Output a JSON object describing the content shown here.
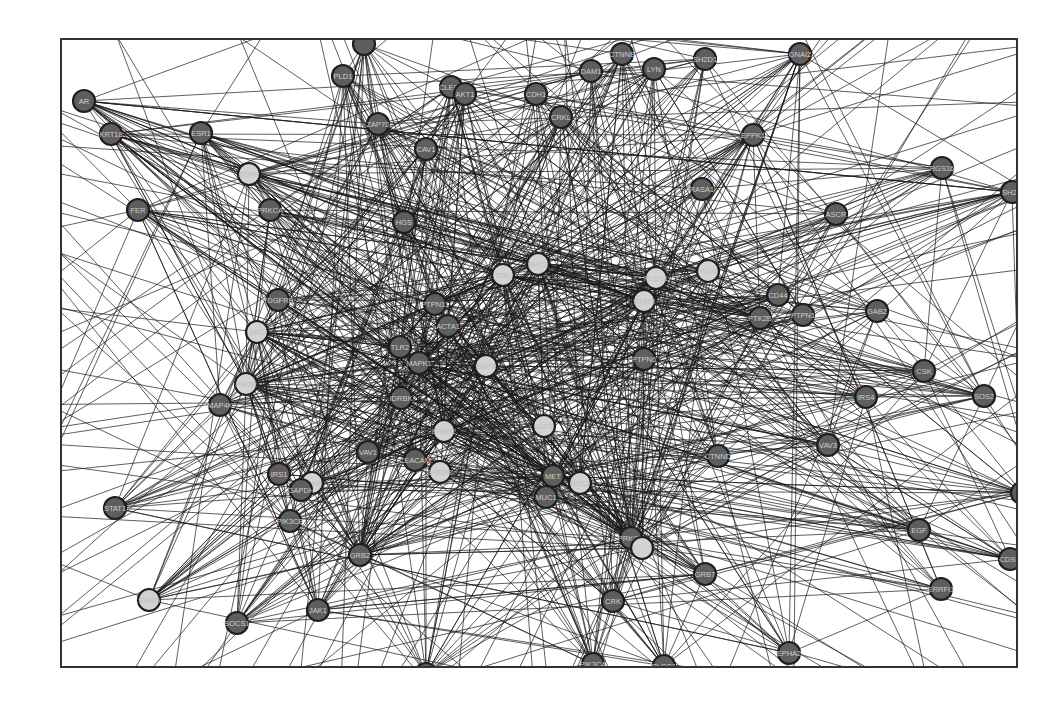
{
  "figure": {
    "type": "protein-protein interaction network",
    "node_color_legend": {
      "hub_or_highlighted": "#d2d2d2",
      "regular": "#5e5e5e"
    }
  },
  "nodes": [
    {
      "id": "AR",
      "label": "AR",
      "shade": "dark",
      "x": 82,
      "y": 99
    },
    {
      "id": "KRT18",
      "label": "KRT18",
      "shade": "dark",
      "x": 109,
      "y": 132
    },
    {
      "id": "ESR1",
      "label": "ESR1",
      "shade": "dark",
      "x": 199,
      "y": 131
    },
    {
      "id": "FER",
      "label": "FER",
      "shade": "dark",
      "x": 136,
      "y": 208
    },
    {
      "id": "PLD1",
      "label": "PLD1",
      "shade": "dark",
      "x": 341,
      "y": 74
    },
    {
      "id": "TOP1",
      "label": "",
      "shade": "dark",
      "x": 362,
      "y": 42
    },
    {
      "id": "CLEC1",
      "label": "CLEC1",
      "shade": "dark",
      "x": 449,
      "y": 85
    },
    {
      "id": "AKT1",
      "label": "AKT1",
      "shade": "dark",
      "x": 463,
      "y": 92
    },
    {
      "id": "ZAP70",
      "label": "ZAP70",
      "shade": "dark",
      "x": 376,
      "y": 122
    },
    {
      "id": "CAV1",
      "label": "CAV1",
      "shade": "dark",
      "x": 424,
      "y": 147
    },
    {
      "id": "CDH1",
      "label": "CDH1",
      "shade": "dark",
      "x": 534,
      "y": 92
    },
    {
      "id": "CRKL",
      "label": "CRKL",
      "shade": "dark",
      "x": 559,
      "y": 115
    },
    {
      "id": "DAM1",
      "label": "DAM1",
      "shade": "dark",
      "x": 589,
      "y": 69
    },
    {
      "id": "CTNNB1",
      "label": "CTNNB",
      "shade": "dark",
      "x": 620,
      "y": 52
    },
    {
      "id": "LYN",
      "label": "LYN",
      "shade": "dark",
      "x": 652,
      "y": 67
    },
    {
      "id": "SH2D1",
      "label": "SH2D1",
      "shade": "dark",
      "x": 703,
      "y": 57
    },
    {
      "id": "GNAI2",
      "label": "GNAI2",
      "shade": "dark",
      "x": 798,
      "y": 52
    },
    {
      "id": "EPPK1",
      "label": "EPPK1",
      "shade": "dark",
      "x": 751,
      "y": 133
    },
    {
      "id": "RGS16",
      "label": "RGS16",
      "shade": "dark",
      "x": 940,
      "y": 166
    },
    {
      "id": "SH2D2",
      "label": "SH2D",
      "shade": "dark",
      "x": 1010,
      "y": 190
    },
    {
      "id": "RASA1",
      "label": "RASA1",
      "shade": "dark",
      "x": 700,
      "y": 187
    },
    {
      "id": "ASCR",
      "label": "ASCR",
      "shade": "dark",
      "x": 834,
      "y": 212
    },
    {
      "id": "EGFR_L",
      "label": "EGFR",
      "shade": "light",
      "x": 247,
      "y": 172
    },
    {
      "id": "PRKCA",
      "label": "PRKCA",
      "shade": "dark",
      "x": 268,
      "y": 208
    },
    {
      "id": "HGS",
      "label": "HGS",
      "shade": "dark",
      "x": 402,
      "y": 220
    },
    {
      "id": "PDGFRB",
      "label": "PDGFRB",
      "shade": "dark",
      "x": 276,
      "y": 298
    },
    {
      "id": "SRC",
      "label": "SRC",
      "shade": "light",
      "x": 255,
      "y": 330
    },
    {
      "id": "PIK3R1",
      "label": "PIK3R",
      "shade": "light",
      "x": 244,
      "y": 382
    },
    {
      "id": "PTPN11",
      "label": "PTPN11",
      "shade": "dark",
      "x": 433,
      "y": 302
    },
    {
      "id": "ACTA1",
      "label": "ACTA1",
      "shade": "dark",
      "x": 446,
      "y": 324
    },
    {
      "id": "TLR2",
      "label": "TLR2",
      "shade": "dark",
      "x": 398,
      "y": 345
    },
    {
      "id": "MAPK1",
      "label": "MAPK1",
      "shade": "dark",
      "x": 417,
      "y": 361
    },
    {
      "id": "EGFR",
      "label": "EGFR",
      "shade": "light",
      "x": 484,
      "y": 364
    },
    {
      "id": "CBL",
      "label": "CBL",
      "shade": "light",
      "x": 501,
      "y": 273
    },
    {
      "id": "SHC1",
      "label": "SHC1",
      "shade": "light",
      "x": 536,
      "y": 262
    },
    {
      "id": "GRB2_L",
      "label": "PLCG1",
      "shade": "light",
      "x": 654,
      "y": 276
    },
    {
      "id": "STAT3_L",
      "label": "STAT3",
      "shade": "light",
      "x": 642,
      "y": 299
    },
    {
      "id": "PLCG",
      "label": "PLCG",
      "shade": "light",
      "x": 706,
      "y": 269
    },
    {
      "id": "CD44",
      "label": "CD44",
      "shade": "dark",
      "x": 776,
      "y": 293
    },
    {
      "id": "PTK2B",
      "label": "PTK2B",
      "shade": "dark",
      "x": 758,
      "y": 316
    },
    {
      "id": "PTPN1",
      "label": "PTPN1",
      "shade": "dark",
      "x": 801,
      "y": 313
    },
    {
      "id": "GAB2",
      "label": "GAB2",
      "shade": "dark",
      "x": 875,
      "y": 309
    },
    {
      "id": "PTPN6",
      "label": "PTPN6",
      "shade": "dark",
      "x": 642,
      "y": 357
    },
    {
      "id": "CSK",
      "label": "CSK",
      "shade": "dark",
      "x": 922,
      "y": 369
    },
    {
      "id": "IRS4",
      "label": "IRS4",
      "shade": "dark",
      "x": 864,
      "y": 395
    },
    {
      "id": "SOS2",
      "label": "SOS2",
      "shade": "dark",
      "x": 982,
      "y": 394
    },
    {
      "id": "VAV3",
      "label": "VAV3",
      "shade": "dark",
      "x": 826,
      "y": 443
    },
    {
      "id": "MAP4K1",
      "label": "MAP4K",
      "shade": "dark",
      "x": 218,
      "y": 403
    },
    {
      "id": "IDRBK",
      "label": "IDRBK",
      "shade": "dark",
      "x": 399,
      "y": 396
    },
    {
      "id": "ERBB2",
      "label": "ERBB2",
      "shade": "light",
      "x": 442,
      "y": 429
    },
    {
      "id": "JAK2_L",
      "label": "JAK2",
      "shade": "light",
      "x": 542,
      "y": 424
    },
    {
      "id": "VAV1",
      "label": "VAV1",
      "shade": "dark",
      "x": 366,
      "y": 450
    },
    {
      "id": "CEACAM1",
      "label": "CEACAM",
      "shade": "dark",
      "x": 413,
      "y": 458
    },
    {
      "id": "ERBB3",
      "label": "ERBB3",
      "shade": "light",
      "x": 438,
      "y": 470
    },
    {
      "id": "MET",
      "label": "MET",
      "shade": "dark",
      "x": 551,
      "y": 474
    },
    {
      "id": "MUC1",
      "label": "MUC1",
      "shade": "dark",
      "x": 544,
      "y": 495
    },
    {
      "id": "NCK1",
      "label": "NCK1",
      "shade": "light",
      "x": 578,
      "y": 481
    },
    {
      "id": "CTNND",
      "label": "CTNND",
      "shade": "dark",
      "x": 716,
      "y": 454
    },
    {
      "id": "IRS1",
      "label": "IRS1",
      "shade": "dark",
      "x": 277,
      "y": 472
    },
    {
      "id": "PTK2",
      "label": "PTK2",
      "shade": "light",
      "x": 310,
      "y": 481
    },
    {
      "id": "GAPDH",
      "label": "GAPDH",
      "shade": "dark",
      "x": 299,
      "y": 488
    },
    {
      "id": "STAT1",
      "label": "STAT1",
      "shade": "dark",
      "x": 113,
      "y": 506
    },
    {
      "id": "PIK3CB",
      "label": "PIK3CB",
      "shade": "dark",
      "x": 288,
      "y": 519
    },
    {
      "id": "PRKCD",
      "label": "PRKCD",
      "shade": "dark",
      "x": 629,
      "y": 536
    },
    {
      "id": "PRKCD_L",
      "label": "",
      "shade": "light",
      "x": 640,
      "y": 546
    },
    {
      "id": "GRB2",
      "label": "GRB2",
      "shade": "dark",
      "x": 358,
      "y": 553
    },
    {
      "id": "GRB7",
      "label": "GRB7",
      "shade": "dark",
      "x": 703,
      "y": 572
    },
    {
      "id": "EGF",
      "label": "EGF",
      "shade": "dark",
      "x": 917,
      "y": 528
    },
    {
      "id": "CDSN",
      "label": "CDSN",
      "shade": "dark",
      "x": 1008,
      "y": 557
    },
    {
      "id": "ERRFI1",
      "label": "ERRFI1",
      "shade": "dark",
      "x": 939,
      "y": 587
    },
    {
      "id": "EDGE_R",
      "label": "",
      "shade": "dark",
      "x": 1020,
      "y": 491
    },
    {
      "id": "CRK",
      "label": "CRK",
      "shade": "dark",
      "x": 611,
      "y": 599
    },
    {
      "id": "STAT5",
      "label": "STAT5",
      "shade": "light",
      "x": 147,
      "y": 598
    },
    {
      "id": "SOCS1",
      "label": "SOCS1",
      "shade": "dark",
      "x": 235,
      "y": 621
    },
    {
      "id": "JAK1",
      "label": "JAK1",
      "shade": "dark",
      "x": 316,
      "y": 608
    },
    {
      "id": "EPHA2",
      "label": "EPHA2",
      "shade": "dark",
      "x": 787,
      "y": 651
    },
    {
      "id": "PLCG1B",
      "label": "PLCG1",
      "shade": "dark",
      "x": 662,
      "y": 664
    },
    {
      "id": "PIK3CA",
      "label": "PIK3CA",
      "shade": "dark",
      "x": 591,
      "y": 662
    },
    {
      "id": "BOTTOM",
      "label": "",
      "shade": "dark",
      "x": 424,
      "y": 672
    }
  ],
  "hubs": [
    "EGFR",
    "CBL",
    "SHC1",
    "PTPN11",
    "MAPK1",
    "GRB2",
    "PIK3R1",
    "SRC",
    "ERBB2",
    "MET",
    "STAT3_L",
    "GRB2_L",
    "PRKCD"
  ],
  "edge_seed": 7,
  "random_edges": 620
}
